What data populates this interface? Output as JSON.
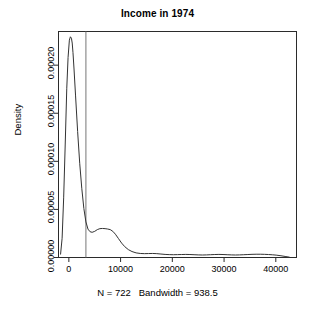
{
  "chart_data": {
    "type": "line",
    "title": "Income in 1974",
    "subtitle": "N = 722   Bandwidth = 938.5",
    "xlabel": "",
    "ylabel": "Density",
    "grid": false,
    "legend": null,
    "xlim": [
      -2000,
      44000
    ],
    "ylim": [
      0,
      0.000235
    ],
    "xticks": [
      0,
      10000,
      20000,
      30000,
      40000
    ],
    "xtick_labels": [
      "0",
      "10000",
      "20000",
      "30000",
      "40000"
    ],
    "yticks": [
      0.0,
      5e-05,
      0.0001,
      0.00015,
      0.0002
    ],
    "ytick_labels": [
      "0.00000",
      "0.00005",
      "0.00010",
      "0.00015",
      "0.00020"
    ],
    "annotations": [
      {
        "name": "vertical-reference-line",
        "type": "vline",
        "x": 3300
      }
    ],
    "series": [
      {
        "name": "density",
        "color": "#333333",
        "x": [
          -1600,
          -1300,
          -1000,
          -700,
          -400,
          -150,
          100,
          300,
          500,
          650,
          800,
          1000,
          1300,
          1700,
          2100,
          2500,
          2900,
          3300,
          3700,
          4100,
          4500,
          5000,
          5500,
          6000,
          6500,
          7000,
          7500,
          8000,
          8500,
          9000,
          9600,
          10200,
          10800,
          11500,
          12200,
          13000,
          13800,
          14600,
          15400,
          16200,
          17000,
          17800,
          18600,
          19400,
          20200,
          21000,
          21800,
          22600,
          23400,
          24200,
          25000,
          25800,
          26600,
          27400,
          28200,
          29000,
          29800,
          30600,
          31400,
          32200,
          33000,
          33800,
          34600,
          35400,
          36200,
          37000,
          37800,
          38600,
          39400,
          40200,
          41000,
          41800,
          42600
        ],
        "y": [
          3.5e-06,
          2e-05,
          6.2e-05,
          0.000118,
          0.000176,
          0.000208,
          0.000226,
          0.0002295,
          0.000228,
          0.000223,
          0.000213,
          0.000196,
          0.000168,
          0.000131,
          9.8e-05,
          7.2e-05,
          5.1e-05,
          3.7e-05,
          2.95e-05,
          2.68e-05,
          2.62e-05,
          2.72e-05,
          2.9e-05,
          3e-05,
          3.02e-05,
          3e-05,
          2.96e-05,
          2.9e-05,
          2.72e-05,
          2.42e-05,
          1.96e-05,
          1.5e-05,
          1.13e-05,
          8.2e-06,
          6.2e-06,
          4.8e-06,
          4.2e-06,
          4e-06,
          4.1e-06,
          4.2e-06,
          4e-06,
          3.6e-06,
          3.2e-06,
          3e-06,
          2.9e-06,
          3e-06,
          3.1e-06,
          3.2e-06,
          3.1e-06,
          2.9e-06,
          2.7e-06,
          2.6e-06,
          2.7e-06,
          2.9e-06,
          3.1e-06,
          3.2e-06,
          3.1e-06,
          2.9e-06,
          2.7e-06,
          2.6e-06,
          2.7e-06,
          2.9e-06,
          3.1e-06,
          3.3e-06,
          3.4e-06,
          3.4e-06,
          3.3e-06,
          3.1e-06,
          2.8e-06,
          2.4e-06,
          1.8e-06,
          1.1e-06,
          4e-07
        ]
      }
    ]
  }
}
